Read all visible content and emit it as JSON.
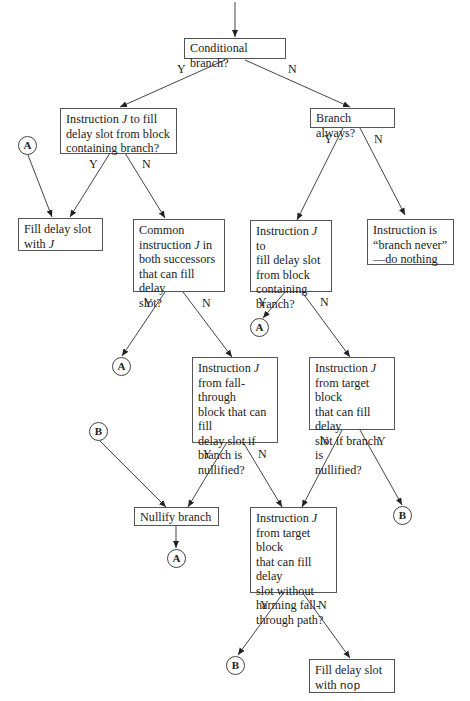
{
  "diagram": {
    "type": "flowchart",
    "nodes": {
      "cond_branch": {
        "text": "Conditional branch?"
      },
      "instr_j_block": {
        "text": "Instruction J to fill\ndelay slot from block\ncontaining branch?"
      },
      "branch_always": {
        "text": "Branch always?"
      },
      "fill_with_j": {
        "text": "Fill delay slot\nwith J"
      },
      "common_instr": {
        "text": "Common\ninstruction J in\nboth successors\nthat can fill delay\nslot?"
      },
      "instr_j_block2": {
        "text": "Instruction J to\nfill delay slot\nfrom block\ncontaining\nbranch?"
      },
      "branch_never": {
        "text": "Instruction is\n“branch never”\n—do nothing"
      },
      "fallthrough_nullified": {
        "text": "Instruction J\nfrom fall-through\nblock that can fill\ndelay slot if\nbranch is\nnullified?"
      },
      "target_nullified": {
        "text": "Instruction J\nfrom target block\nthat can fill delay\nslot if branch is\nnullified?"
      },
      "nullify_branch": {
        "text": "Nullify branch"
      },
      "target_no_harm": {
        "text": "Instruction J\nfrom target block\nthat can fill delay\nslot without\nharming fall-\nthrough path?"
      },
      "fill_nop_prefix": {
        "text": "Fill delay slot\nwith "
      },
      "fill_nop_code": {
        "text": "nop"
      }
    },
    "connectors": {
      "a": "A",
      "b": "B"
    },
    "edge_labels": {
      "yes": "Y",
      "no": "N"
    }
  }
}
